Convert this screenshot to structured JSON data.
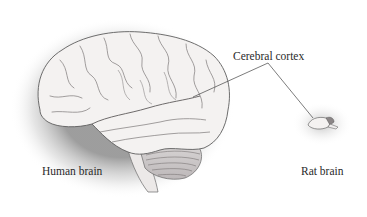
{
  "figure": {
    "labels": {
      "cerebral_cortex": "Cerebral cortex",
      "human_brain": "Human brain",
      "rat_brain": "Rat brain"
    },
    "colors": {
      "background": "#ffffff",
      "brain_fill": "#f4f2f1",
      "brain_stroke": "#6a6a6a",
      "halo": "#8a8a8a",
      "leader_line": "#444444",
      "text": "#2a2a2a"
    }
  }
}
